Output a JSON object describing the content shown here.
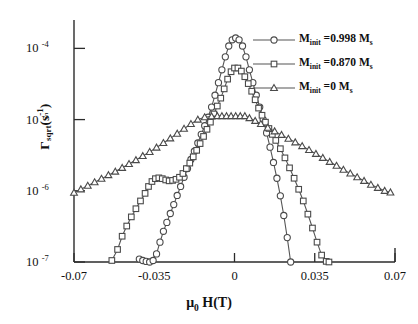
{
  "chart_data": {
    "type": "line",
    "title": "",
    "xlabel": "μ 0 H(T)",
    "ylabel": "Γsqrt(s-1)",
    "xlim": [
      -0.07,
      0.07
    ],
    "ylim": [
      1e-07,
      0.00022
    ],
    "yscale": "log",
    "grid": false,
    "legend_position": "top-right",
    "xticks": [
      "-0.07",
      "-0.035",
      "0",
      "0.035",
      "0.07"
    ],
    "xtick_values": [
      -0.07,
      -0.035,
      0,
      0.035,
      0.07
    ],
    "yticks": [
      "10-4",
      "10-5",
      "10-6",
      "10-7"
    ],
    "ytick_values": [
      0.0001,
      1e-05,
      1e-06,
      1e-07
    ],
    "series": [
      {
        "name": "M_init =0.998 M_s",
        "marker": "circle",
        "x": [
          -0.0415,
          -0.04,
          -0.0385,
          -0.037,
          -0.0355,
          -0.034,
          -0.0325,
          -0.031,
          -0.0295,
          -0.028,
          -0.0265,
          -0.025,
          -0.0235,
          -0.022,
          -0.0205,
          -0.019,
          -0.0175,
          -0.016,
          -0.0145,
          -0.013,
          -0.0115,
          -0.01,
          -0.0085,
          -0.007,
          -0.0055,
          -0.004,
          -0.0025,
          -0.001,
          0.0005,
          0.002,
          0.0035,
          0.005,
          0.0065,
          0.008,
          0.0095,
          0.011,
          0.0125,
          0.014,
          0.0155,
          0.017,
          0.0185,
          0.02,
          0.0215,
          0.023,
          0.0245
        ],
        "y": [
          1.1e-07,
          1.05e-07,
          1.02e-07,
          1e-07,
          1.05e-07,
          1.3e-07,
          1.9e-07,
          2.7e-07,
          3.6e-07,
          4.8e-07,
          6.4e-07,
          8.6e-07,
          1.15e-06,
          1.55e-06,
          2.05e-06,
          2.75e-06,
          3.6e-06,
          4.7e-06,
          6.2e-06,
          8.2e-06,
          1.08e-05,
          1.5e-05,
          2.2e-05,
          3.3e-05,
          5e-05,
          7.6e-05,
          0.000108,
          0.000132,
          0.00014,
          0.000132,
          0.000108,
          7.6e-05,
          5e-05,
          3.3e-05,
          2.2e-05,
          1.5e-05,
          1e-05,
          6.5e-06,
          4.1e-06,
          2.5e-06,
          1.5e-06,
          8.5e-07,
          4.5e-07,
          2.2e-07,
          1e-07
        ]
      },
      {
        "name": "M_init =0.870 M_s",
        "marker": "square",
        "x": [
          -0.0535,
          -0.051,
          -0.049,
          -0.047,
          -0.045,
          -0.043,
          -0.041,
          -0.039,
          -0.0375,
          -0.036,
          -0.0345,
          -0.033,
          -0.0315,
          -0.03,
          -0.0285,
          -0.027,
          -0.0255,
          -0.024,
          -0.0225,
          -0.021,
          -0.0195,
          -0.018,
          -0.0165,
          -0.015,
          -0.0135,
          -0.012,
          -0.0105,
          -0.009,
          -0.0075,
          -0.006,
          -0.0045,
          -0.003,
          -0.0015,
          0.0,
          0.0015,
          0.003,
          0.0045,
          0.006,
          0.0075,
          0.009,
          0.0105,
          0.012,
          0.0135,
          0.015,
          0.0165,
          0.018,
          0.02,
          0.022,
          0.024,
          0.026,
          0.028,
          0.03,
          0.032,
          0.034,
          0.036,
          0.038,
          0.04,
          0.0412
        ],
        "y": [
          1.05e-07,
          1.5e-07,
          2.3e-07,
          3.2e-07,
          4.3e-07,
          5.6e-07,
          7.2e-07,
          9.2e-07,
          1.15e-06,
          1.35e-06,
          1.48e-06,
          1.52e-06,
          1.48e-06,
          1.42e-06,
          1.38e-06,
          1.4e-06,
          1.45e-06,
          1.55e-06,
          1.75e-06,
          2.05e-06,
          2.45e-06,
          3e-06,
          3.7e-06,
          4.6e-06,
          5.8e-06,
          7.3e-06,
          9.2e-06,
          1.2e-05,
          1.55e-05,
          2e-05,
          2.7e-05,
          3.7e-05,
          4.7e-05,
          5.3e-05,
          5.3e-05,
          4.8e-05,
          4e-05,
          3.2e-05,
          2.5e-05,
          1.9e-05,
          1.45e-05,
          1.15e-05,
          9.2e-06,
          7.5e-06,
          6.2e-06,
          5.1e-06,
          3.9e-06,
          2.9e-06,
          2.1e-06,
          1.5e-06,
          1.05e-06,
          7.2e-07,
          4.7e-07,
          3e-07,
          1.9e-07,
          1.25e-07,
          1.02e-07,
          1e-07
        ]
      },
      {
        "name": "M_init =0 M_s",
        "marker": "triangle",
        "x": [
          -0.07,
          -0.067,
          -0.064,
          -0.061,
          -0.058,
          -0.055,
          -0.052,
          -0.049,
          -0.046,
          -0.043,
          -0.04,
          -0.037,
          -0.034,
          -0.031,
          -0.028,
          -0.025,
          -0.022,
          -0.019,
          -0.016,
          -0.013,
          -0.01,
          -0.0075,
          -0.0055,
          -0.0035,
          -0.0015,
          0.0005,
          0.0025,
          0.0045,
          0.0065,
          0.009,
          0.0115,
          0.0145,
          0.0175,
          0.0205,
          0.0235,
          0.0265,
          0.0295,
          0.0325,
          0.0355,
          0.0385,
          0.0415,
          0.0445,
          0.0475,
          0.0505,
          0.0535,
          0.0565,
          0.0595,
          0.0625,
          0.0655,
          0.068
        ],
        "y": [
          9.4e-07,
          1.05e-06,
          1.18e-06,
          1.32e-06,
          1.48e-06,
          1.66e-06,
          1.86e-06,
          2.1e-06,
          2.38e-06,
          2.7e-06,
          3.08e-06,
          3.52e-06,
          4.05e-06,
          4.7e-06,
          5.45e-06,
          6.35e-06,
          7.45e-06,
          8.7e-06,
          1e-05,
          1.08e-05,
          1.11e-05,
          1.12e-05,
          1.12e-05,
          1.12e-05,
          1.12e-05,
          1.12e-05,
          1.12e-05,
          1.12e-05,
          1.05e-05,
          9.6e-06,
          8.7e-06,
          7.7e-06,
          6.85e-06,
          6.1e-06,
          5.4e-06,
          4.8e-06,
          4.25e-06,
          3.75e-06,
          3.3e-06,
          2.9e-06,
          2.55e-06,
          2.25e-06,
          1.98e-06,
          1.75e-06,
          1.55e-06,
          1.38e-06,
          1.22e-06,
          1.1e-06,
          1e-06,
          9.5e-07
        ]
      }
    ]
  },
  "axes": {
    "ylabel_main": "Γ",
    "ylabel_sub": "sqrt",
    "ylabel_unit_open": "(s",
    "ylabel_unit_sup": "-1",
    "ylabel_unit_close": ")",
    "xlabel_mu": "μ",
    "xlabel_sub": "0",
    "xlabel_rest": "H(T)"
  },
  "legend": {
    "items": [
      {
        "prefix": "M",
        "sub": "init",
        "value": " =0.998 M",
        "value_sub": "s",
        "marker": "circle-marker"
      },
      {
        "prefix": "M",
        "sub": "init",
        "value": " =0.870 M",
        "value_sub": "s",
        "marker": "square-marker"
      },
      {
        "prefix": "M",
        "sub": "init",
        "value": " =0 M",
        "value_sub": "s",
        "marker": "triangle-marker"
      }
    ]
  },
  "ticks": {
    "x": [
      {
        "label": "-0.07",
        "value": -0.07
      },
      {
        "label": "-0.035",
        "value": -0.035
      },
      {
        "label": "0",
        "value": 0
      },
      {
        "label": "0.035",
        "value": 0.035
      },
      {
        "label": "0.07",
        "value": 0.07
      }
    ],
    "y": [
      {
        "base": "10",
        "exp": "-4",
        "value": 0.0001
      },
      {
        "base": "10",
        "exp": "-5",
        "value": 1e-05
      },
      {
        "base": "10",
        "exp": "-6",
        "value": 1e-06
      },
      {
        "base": "10",
        "exp": "-7",
        "value": 1e-07
      }
    ]
  },
  "colors": {
    "axis": "#2b2b2b",
    "line": "#555555",
    "marker_stroke": "#4a4a4a",
    "marker_fill": "#ffffff",
    "background": "#ffffff"
  }
}
